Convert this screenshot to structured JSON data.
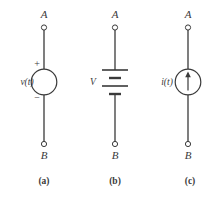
{
  "figure": {
    "title": "",
    "stroke_color": "#3a3a3a",
    "background_color": "#ffffff",
    "terminal_fill": "#ffffff"
  },
  "circuits": [
    {
      "id": "voltage-source",
      "caption": "(a)",
      "top_terminal_label": "A",
      "bottom_terminal_label": "B",
      "element_type": "circle-source",
      "source_label": "v(t)",
      "plus_sign": "+",
      "minus_sign": "−",
      "center_x": 44
    },
    {
      "id": "battery",
      "caption": "(b)",
      "top_terminal_label": "A",
      "bottom_terminal_label": "B",
      "element_type": "battery",
      "source_label": "V",
      "center_x": 115
    },
    {
      "id": "current-source",
      "caption": "(c)",
      "top_terminal_label": "A",
      "bottom_terminal_label": "B",
      "element_type": "circle-source-arrow",
      "source_label": "i(t)",
      "arrow_direction": "up",
      "center_x": 188
    }
  ]
}
